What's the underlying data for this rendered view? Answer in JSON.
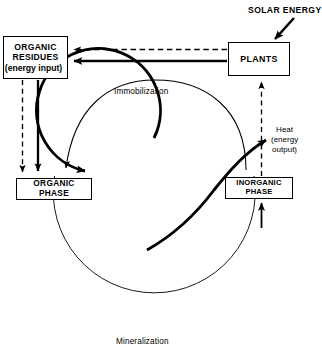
{
  "diagram": {
    "type": "cycle-diagram",
    "canvas": {
      "width": 322,
      "height": 355,
      "background": "#ffffff"
    },
    "colors": {
      "line": "#000000",
      "box_fill": "#ffffff",
      "text": "#000000"
    }
  },
  "nodes": {
    "organic_residues": {
      "line1": "ORGANIC",
      "line2": "RESIDUES",
      "line3": "(energy input)"
    },
    "plants": {
      "line1": "PLANTS"
    },
    "organic_phase": {
      "line1": "ORGANIC",
      "line2": "PHASE"
    },
    "inorganic_phase": {
      "line1": "INORGANIC",
      "line2": "PHASE"
    }
  },
  "labels": {
    "solar_energy": "SOLAR ENERGY",
    "immobilization": "Immobilization",
    "mineralization": "Mineralization",
    "heat_line1": "Heat",
    "heat_line2": "(energy",
    "heat_line3": "output)"
  },
  "connectors": [
    {
      "name": "plants-to-organic-residues-dashed",
      "style": "dashed",
      "weight": "thin",
      "arrow": "left"
    },
    {
      "name": "plants-to-organic-residues-solid",
      "style": "solid",
      "weight": "thick",
      "arrow": "left"
    },
    {
      "name": "organic-residues-to-organic-phase-dashed",
      "style": "dashed",
      "weight": "thin",
      "arrow": "down"
    },
    {
      "name": "organic-residues-to-organic-phase-solid",
      "style": "solid",
      "weight": "thick",
      "arrow": "down"
    },
    {
      "name": "inorganic-phase-to-plants-dashed",
      "style": "dashed",
      "weight": "thin",
      "arrow": "up"
    },
    {
      "name": "solar-energy-to-plants",
      "style": "solid",
      "weight": "thick",
      "arrow": "down-left"
    },
    {
      "name": "immobilization-arc",
      "style": "solid",
      "weight": "thin",
      "arrow": "down-left"
    },
    {
      "name": "mineralization-arc",
      "style": "solid",
      "weight": "thin",
      "arrow": "none"
    },
    {
      "name": "inner-cycle-arc",
      "style": "solid",
      "weight": "thick",
      "arrow": "down-left"
    },
    {
      "name": "heat-output-arc",
      "style": "solid",
      "weight": "thick",
      "arrow": "up-right"
    }
  ]
}
